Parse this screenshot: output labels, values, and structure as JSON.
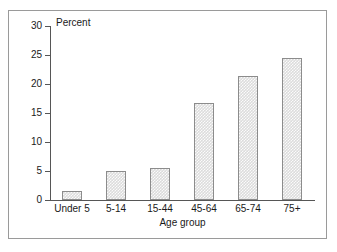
{
  "chart_data": {
    "type": "bar",
    "title": "",
    "subtitle": "",
    "xlabel": "Age group",
    "ylabel": "Percent",
    "categories": [
      "Under 5",
      "5-14",
      "15-44",
      "45-64",
      "65-74",
      "75+"
    ],
    "values": [
      1.5,
      5.0,
      5.6,
      16.8,
      21.3,
      24.4
    ],
    "series": [
      {
        "name": "Percent",
        "values": [
          1.5,
          5.0,
          5.6,
          16.8,
          21.3,
          24.4
        ]
      }
    ],
    "ylim": [
      0,
      30
    ],
    "yticks": [
      0,
      5,
      10,
      15,
      20,
      25,
      30
    ],
    "ytick_labels": [
      "0",
      "5",
      "10",
      "15",
      "20",
      "25",
      "30"
    ],
    "grid": false,
    "legend": false,
    "legend_position": "none",
    "bar_fill_color": "#dcdcdc",
    "bar_edge_color": "#8c8c8c",
    "axis_color": "#565656",
    "frame_color": "#9a9a9a",
    "text_color": "#1a1a1a"
  },
  "axes": {
    "y_axis_title": "Percent",
    "x_axis_title": "Age group"
  }
}
